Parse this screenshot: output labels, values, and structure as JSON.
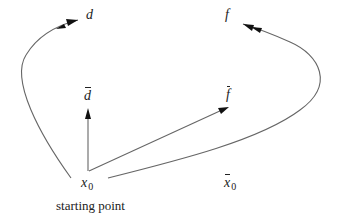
{
  "diagram": {
    "labels": {
      "d": "d",
      "f": "f",
      "d_bar": "d",
      "f_bar": "f",
      "x0_var": "x",
      "x0_sub": "0",
      "xbar0_var": "x",
      "xbar0_sub": "0",
      "starting_point": "starting point"
    },
    "colors": {
      "stroke": "#666666",
      "arrowhead": "#111111",
      "text": "#222222"
    },
    "edges": [
      {
        "from": "x0",
        "to": "d",
        "type": "curve",
        "arrowhead": "double"
      },
      {
        "from": "x_bar0",
        "to": "f",
        "type": "curve",
        "arrowhead": "double"
      },
      {
        "from": "x0",
        "to": "d_bar",
        "type": "straight",
        "arrowhead": "single"
      },
      {
        "from": "x0",
        "to": "f_bar",
        "type": "straight",
        "arrowhead": "single"
      }
    ]
  }
}
